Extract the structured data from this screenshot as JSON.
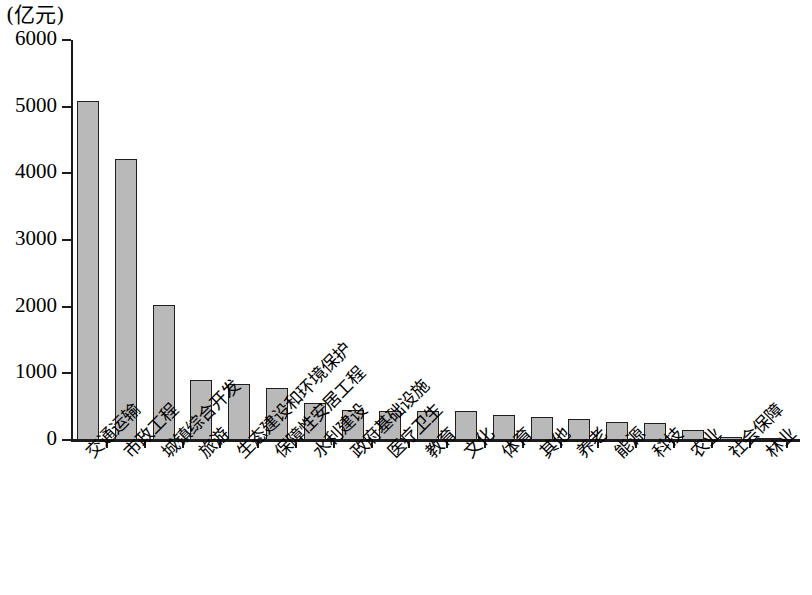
{
  "chart_data": {
    "type": "bar",
    "title": "",
    "subtitle": "",
    "unit_label": "(亿元)",
    "xlabel": "",
    "ylabel": "",
    "ylim": [
      0,
      6000
    ],
    "ytick_labels": [
      "6000",
      "5000",
      "4000",
      "3000",
      "2000",
      "1000",
      "0"
    ],
    "ytick_values": [
      6000,
      5000,
      4000,
      3000,
      2000,
      1000,
      0
    ],
    "grid": false,
    "legend": false,
    "legend_position": "none",
    "bar_fill_color": "#b9b9b9",
    "bar_border_color": "#1f1f1f",
    "axis_color": "#1a1a1a",
    "background_color": "#ffffff",
    "categories": [
      "交通运输",
      "市政工程",
      "城镇综合开发",
      "旅游",
      "生态建设和环境保护",
      "保障性安居工程",
      "水利建设",
      "政府基础设施",
      "医疗卫生",
      "教育",
      "文化",
      "体育",
      "其他",
      "养老",
      "能源",
      "科技",
      "农业",
      "社会保障",
      "林业"
    ],
    "values": [
      5080,
      4220,
      2020,
      900,
      840,
      780,
      560,
      450,
      440,
      430,
      430,
      370,
      350,
      320,
      270,
      260,
      150,
      40,
      35
    ],
    "series": [
      {
        "name": "投资额",
        "values": [
          5080,
          4220,
          2020,
          900,
          840,
          780,
          560,
          450,
          440,
          430,
          430,
          370,
          350,
          320,
          270,
          260,
          150,
          40,
          35
        ]
      }
    ]
  }
}
